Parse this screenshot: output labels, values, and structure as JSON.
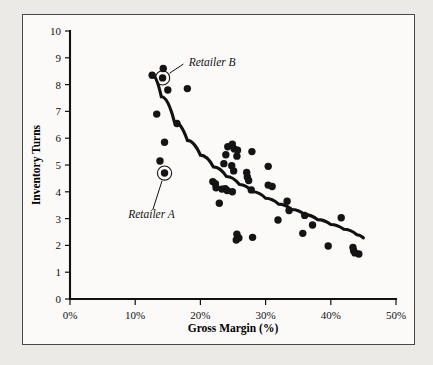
{
  "figure": {
    "background_color": "#eceae7",
    "panel_color": "#fbfaf9",
    "border_color": "#4a4846",
    "ink_color": "#141414"
  },
  "chart_data": {
    "type": "scatter",
    "title": "",
    "xlabel": "Gross Margin (%)",
    "ylabel": "Inventory Turns",
    "xlim": [
      0,
      50
    ],
    "ylim": [
      0,
      10
    ],
    "xticks": [
      0,
      10,
      20,
      30,
      40,
      50
    ],
    "xtick_labels": [
      "0%",
      "10%",
      "20%",
      "30%",
      "40%",
      "50%"
    ],
    "yticks": [
      0,
      1,
      2,
      3,
      4,
      5,
      6,
      7,
      8,
      9,
      10
    ],
    "ytick_labels": [
      "0",
      "1",
      "2",
      "3",
      "4",
      "5",
      "6",
      "7",
      "8",
      "9",
      "10"
    ],
    "grid": false,
    "legend": false,
    "marker_color": "#141414",
    "marker_size_px": 7.4,
    "series": [
      {
        "name": "Retailers",
        "points": [
          [
            14.3,
            8.6
          ],
          [
            12.6,
            8.35
          ],
          [
            14.2,
            8.25
          ],
          [
            15.0,
            7.8
          ],
          [
            18.0,
            7.85
          ],
          [
            13.3,
            6.9
          ],
          [
            16.4,
            6.55
          ],
          [
            14.5,
            5.85
          ],
          [
            13.8,
            5.15
          ],
          [
            14.5,
            4.7
          ],
          [
            24.9,
            5.78
          ],
          [
            24.2,
            5.68
          ],
          [
            25.2,
            5.6
          ],
          [
            25.7,
            5.55
          ],
          [
            27.9,
            5.5
          ],
          [
            23.9,
            5.38
          ],
          [
            25.6,
            5.33
          ],
          [
            23.6,
            5.05
          ],
          [
            24.8,
            4.97
          ],
          [
            30.4,
            4.95
          ],
          [
            25.1,
            4.78
          ],
          [
            27.1,
            4.72
          ],
          [
            27.2,
            4.55
          ],
          [
            27.4,
            4.42
          ],
          [
            21.9,
            4.38
          ],
          [
            22.3,
            4.3
          ],
          [
            30.4,
            4.25
          ],
          [
            31.0,
            4.2
          ],
          [
            22.4,
            4.15
          ],
          [
            23.3,
            4.1
          ],
          [
            23.8,
            4.12
          ],
          [
            24.1,
            4.05
          ],
          [
            24.9,
            4.0
          ],
          [
            27.8,
            4.07
          ],
          [
            33.3,
            3.65
          ],
          [
            22.9,
            3.57
          ],
          [
            33.6,
            3.3
          ],
          [
            36.0,
            3.12
          ],
          [
            41.6,
            3.03
          ],
          [
            31.9,
            2.95
          ],
          [
            37.2,
            2.76
          ],
          [
            35.7,
            2.45
          ],
          [
            25.6,
            2.42
          ],
          [
            25.9,
            2.28
          ],
          [
            28.0,
            2.3
          ],
          [
            25.5,
            2.2
          ],
          [
            39.6,
            1.98
          ],
          [
            43.4,
            1.92
          ],
          [
            43.5,
            1.8
          ],
          [
            43.7,
            1.72
          ],
          [
            44.3,
            1.68
          ]
        ]
      }
    ],
    "trend_curve": {
      "description": "fitted power-law decay trend line",
      "stroke_color": "#111111",
      "stroke_width_px": 3.1,
      "points": [
        [
          12.5,
          8.38
        ],
        [
          14.0,
          7.55
        ],
        [
          16.0,
          6.62
        ],
        [
          18.0,
          5.92
        ],
        [
          20.0,
          5.37
        ],
        [
          22.0,
          4.93
        ],
        [
          24.0,
          4.57
        ],
        [
          26.0,
          4.27
        ],
        [
          28.0,
          4.0
        ],
        [
          30.0,
          3.76
        ],
        [
          32.0,
          3.54
        ],
        [
          34.0,
          3.34
        ],
        [
          36.0,
          3.15
        ],
        [
          38.0,
          2.96
        ],
        [
          40.0,
          2.78
        ],
        [
          42.0,
          2.6
        ],
        [
          44.0,
          2.4
        ],
        [
          45.0,
          2.28
        ]
      ]
    },
    "annotations": [
      {
        "label": "Retailer B",
        "point": [
          14.2,
          8.25
        ],
        "label_position": [
          17.9,
          8.85
        ],
        "highlight": "circle-ring"
      },
      {
        "label": "Retailer A",
        "point": [
          14.5,
          4.7
        ],
        "label_position": [
          12.5,
          3.18
        ],
        "highlight": "circle-ring"
      }
    ]
  }
}
